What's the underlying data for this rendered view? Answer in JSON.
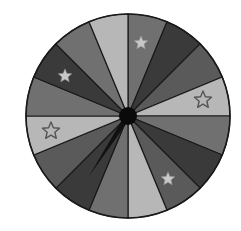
{
  "wheel": {
    "center": [
      128,
      116
    ],
    "radius": 102,
    "segment_count": 16,
    "segment_angle_deg": 22.5,
    "colors": {
      "light": "#b7b7b7",
      "medium": "#707070",
      "medium_dark": "#5a5a5a",
      "dark": "#3a3a3a",
      "outline": "#1a1a1a",
      "hub": "#0a0a0a",
      "star_fill": "#c8c8c8",
      "star_outline": "#555555"
    },
    "segments": [
      {
        "index": 0,
        "start_deg": 0,
        "shade": "medium",
        "star": "filled"
      },
      {
        "index": 1,
        "start_deg": 22.5,
        "shade": "dark",
        "star": null
      },
      {
        "index": 2,
        "start_deg": 45,
        "shade": "medium_dark",
        "star": null
      },
      {
        "index": 3,
        "start_deg": 67.5,
        "shade": "light",
        "star": "outline"
      },
      {
        "index": 4,
        "start_deg": 90,
        "shade": "medium",
        "star": null
      },
      {
        "index": 5,
        "start_deg": 112.5,
        "shade": "dark",
        "star": null
      },
      {
        "index": 6,
        "start_deg": 135,
        "shade": "medium_dark",
        "star": "filled"
      },
      {
        "index": 7,
        "start_deg": 157.5,
        "shade": "light",
        "star": null
      },
      {
        "index": 8,
        "start_deg": 180,
        "shade": "medium",
        "star": null
      },
      {
        "index": 9,
        "start_deg": 202.5,
        "shade": "dark",
        "star": null
      },
      {
        "index": 10,
        "start_deg": 225,
        "shade": "medium_dark",
        "star": null
      },
      {
        "index": 11,
        "start_deg": 247.5,
        "shade": "light",
        "star": "outline"
      },
      {
        "index": 12,
        "start_deg": 270,
        "shade": "medium",
        "star": null
      },
      {
        "index": 13,
        "start_deg": 292.5,
        "shade": "dark",
        "star": "filled"
      },
      {
        "index": 14,
        "start_deg": 315,
        "shade": "medium",
        "star": null
      },
      {
        "index": 15,
        "start_deg": 337.5,
        "shade": "light",
        "star": null
      }
    ],
    "stars": [
      {
        "x": 141,
        "y": 43,
        "style": "filled",
        "size": 7
      },
      {
        "x": 203,
        "y": 100,
        "style": "outline",
        "size": 9
      },
      {
        "x": 168,
        "y": 179,
        "style": "filled",
        "size": 7
      },
      {
        "x": 51,
        "y": 131,
        "style": "outline",
        "size": 9
      },
      {
        "x": 65,
        "y": 76,
        "style": "filled",
        "size": 7
      }
    ],
    "hub": {
      "radius": 9
    },
    "pointer": {
      "icon": "spinner-needle-icon",
      "angle_deg": 213,
      "length": 72,
      "base_width": 6
    }
  }
}
